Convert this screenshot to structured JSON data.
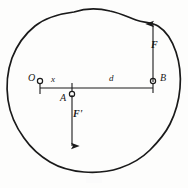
{
  "figure": {
    "type": "mechanics-free-body-diagram",
    "stroke_color": "#1a1a1a",
    "background_color": "#fdfdfc",
    "points": [
      {
        "id": "O",
        "label": "O",
        "x": 40,
        "y": 83,
        "marker": "open-circle"
      },
      {
        "id": "A",
        "label": "A",
        "x": 72,
        "y": 88,
        "marker": "open-circle"
      },
      {
        "id": "B",
        "label": "B",
        "x": 153,
        "y": 83,
        "marker": "open-circle"
      }
    ],
    "dimensions": [
      {
        "id": "x",
        "label": "x",
        "from": "O",
        "to": "A"
      },
      {
        "id": "d",
        "label": "d",
        "from": "A",
        "to": "B"
      }
    ],
    "forces": [
      {
        "id": "F",
        "label": "F",
        "applied_at": "B",
        "direction": "up"
      },
      {
        "id": "Fprime",
        "label": "F'",
        "applied_at": "A",
        "direction": "down"
      }
    ]
  }
}
